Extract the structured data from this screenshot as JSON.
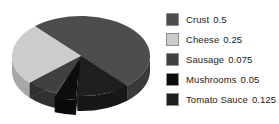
{
  "chart_data": {
    "type": "pie",
    "title": "",
    "subtitle": "",
    "xlabel": "",
    "ylabel": "",
    "grid": false,
    "legend_position": "right",
    "three_d": true,
    "categories": [
      "Crust",
      "Cheese",
      "Sausage",
      "Mushrooms",
      "Tomato Sauce"
    ],
    "values": [
      0.5,
      0.25,
      0.075,
      0.05,
      0.125
    ],
    "value_labels": [
      "0.5",
      "0.25",
      "0.075",
      "0.05",
      "0.125"
    ],
    "colors": [
      "#4d4d4d",
      "#cccccc",
      "#404040",
      "#0d0d0d",
      "#1f1f1f"
    ],
    "exploded": [
      "Mushrooms"
    ],
    "slices": [
      {
        "label": "Crust",
        "value": 0.5,
        "value_label": "0.5",
        "color": "#4d4d4d",
        "side_color": "#3a3a3a",
        "start_angle": -48,
        "end_angle": 132,
        "exploded": false
      },
      {
        "label": "Cheese",
        "value": 0.25,
        "value_label": "0.25",
        "color": "#cccccc",
        "side_color": "#a8a8a8",
        "start_angle": 132,
        "end_angle": 222,
        "exploded": false
      },
      {
        "label": "Sausage",
        "value": 0.075,
        "value_label": "0.075",
        "color": "#404040",
        "side_color": "#303030",
        "start_angle": 222,
        "end_angle": 249,
        "exploded": false
      },
      {
        "label": "Mushrooms",
        "value": 0.05,
        "value_label": "0.05",
        "color": "#0d0d0d",
        "side_color": "#0a0a0a",
        "start_angle": 249,
        "end_angle": 267,
        "exploded": true
      },
      {
        "label": "Tomato Sauce",
        "value": 0.125,
        "value_label": "0.125",
        "color": "#1f1f1f",
        "side_color": "#171717",
        "start_angle": 267,
        "end_angle": 312,
        "exploded": false
      }
    ]
  },
  "legend": {
    "items": [
      {
        "label": "Crust",
        "value": "0.5",
        "color": "#4d4d4d"
      },
      {
        "label": "Cheese",
        "value": "0.25",
        "color": "#cccccc"
      },
      {
        "label": "Sausage",
        "value": "0.075",
        "color": "#404040"
      },
      {
        "label": "Mushrooms",
        "value": "0.05",
        "color": "#0d0d0d"
      },
      {
        "label": "Tomato Sauce",
        "value": "0.125",
        "color": "#1f1f1f"
      }
    ]
  },
  "background_color": "#ffffff"
}
